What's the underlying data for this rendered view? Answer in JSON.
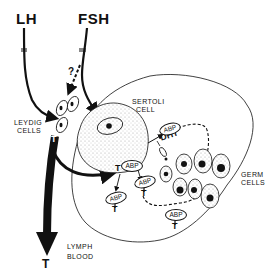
{
  "diagram": {
    "hormones": {
      "lh": "LH",
      "fsh": "FSH"
    },
    "question_mark": "?",
    "labels": {
      "leydig_line1": "LEYDIG",
      "leydig_line2": "CELLS",
      "sertoli_line1": "SERTOLI",
      "sertoli_line2": "CELL",
      "germ_line1": "GERM",
      "germ_line2": "CELLS",
      "lymph": "LYMPH",
      "blood": "BLOOD"
    },
    "molecules": {
      "testosterone": "T",
      "dht": "DHT",
      "abp": [
        "ABP",
        "ABP",
        "ABP",
        "ABP",
        "ABP",
        "ABP"
      ]
    },
    "colors": {
      "ink": "#111111",
      "background": "#ffffff",
      "stipple": "#bbbbbb"
    }
  }
}
